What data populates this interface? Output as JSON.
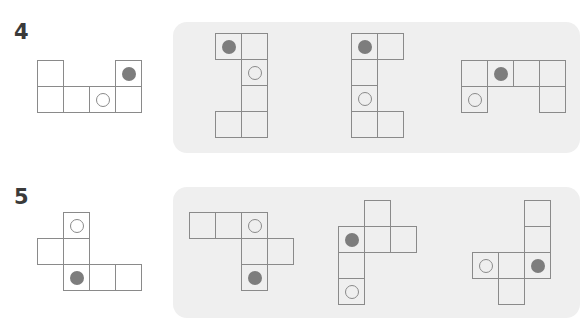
{
  "cell_size": 26,
  "colors": {
    "panel_bg": "#efefef",
    "line": "#8a8a8a",
    "dot": "#7d7d7d",
    "number": "#3a3a3a"
  },
  "problems": [
    {
      "number": "4",
      "number_pos": [
        14,
        22
      ],
      "net": {
        "origin": [
          37,
          60
        ],
        "cells": [
          {
            "c": 0,
            "r": 0
          },
          {
            "c": 3,
            "r": 0,
            "mark": "dot"
          },
          {
            "c": 0,
            "r": 1
          },
          {
            "c": 1,
            "r": 1
          },
          {
            "c": 2,
            "r": 1,
            "mark": "ring"
          },
          {
            "c": 3,
            "r": 1
          }
        ]
      },
      "panel": {
        "x": 173,
        "y": 22,
        "w": 407,
        "h": 131
      },
      "options": [
        {
          "origin": [
            215,
            33
          ],
          "cells": [
            {
              "c": 0,
              "r": 0,
              "mark": "dot"
            },
            {
              "c": 1,
              "r": 0
            },
            {
              "c": 1,
              "r": 1,
              "mark": "ring"
            },
            {
              "c": 1,
              "r": 2
            },
            {
              "c": 0,
              "r": 3
            },
            {
              "c": 1,
              "r": 3
            }
          ]
        },
        {
          "origin": [
            351,
            33
          ],
          "cells": [
            {
              "c": 0,
              "r": 0,
              "mark": "dot"
            },
            {
              "c": 1,
              "r": 0
            },
            {
              "c": 0,
              "r": 1
            },
            {
              "c": 0,
              "r": 2,
              "mark": "ring"
            },
            {
              "c": 0,
              "r": 3
            },
            {
              "c": 1,
              "r": 3
            }
          ]
        },
        {
          "origin": [
            461,
            60
          ],
          "cells": [
            {
              "c": 0,
              "r": 0
            },
            {
              "c": 1,
              "r": 0,
              "mark": "dot"
            },
            {
              "c": 2,
              "r": 0
            },
            {
              "c": 3,
              "r": 0
            },
            {
              "c": 0,
              "r": 1,
              "mark": "ring"
            },
            {
              "c": 3,
              "r": 1
            }
          ]
        }
      ]
    },
    {
      "number": "5",
      "number_pos": [
        14,
        187
      ],
      "net": {
        "origin": [
          37,
          212
        ],
        "cells": [
          {
            "c": 1,
            "r": 0,
            "mark": "ring"
          },
          {
            "c": 0,
            "r": 1
          },
          {
            "c": 1,
            "r": 1
          },
          {
            "c": 1,
            "r": 2,
            "mark": "dot"
          },
          {
            "c": 2,
            "r": 2
          },
          {
            "c": 3,
            "r": 2
          }
        ]
      },
      "panel": {
        "x": 173,
        "y": 187,
        "w": 407,
        "h": 131
      },
      "options": [
        {
          "origin": [
            189,
            212
          ],
          "cells": [
            {
              "c": 0,
              "r": 0
            },
            {
              "c": 1,
              "r": 0
            },
            {
              "c": 2,
              "r": 0,
              "mark": "ring"
            },
            {
              "c": 2,
              "r": 1
            },
            {
              "c": 3,
              "r": 1
            },
            {
              "c": 2,
              "r": 2,
              "mark": "dot"
            }
          ]
        },
        {
          "origin": [
            338,
            200
          ],
          "cells": [
            {
              "c": 1,
              "r": 0
            },
            {
              "c": 0,
              "r": 1,
              "mark": "dot"
            },
            {
              "c": 1,
              "r": 1
            },
            {
              "c": 2,
              "r": 1
            },
            {
              "c": 0,
              "r": 2
            },
            {
              "c": 0,
              "r": 3,
              "mark": "ring"
            }
          ]
        },
        {
          "origin": [
            472,
            200
          ],
          "cells": [
            {
              "c": 2,
              "r": 0
            },
            {
              "c": 2,
              "r": 1
            },
            {
              "c": 0,
              "r": 2,
              "mark": "ring"
            },
            {
              "c": 1,
              "r": 2
            },
            {
              "c": 2,
              "r": 2,
              "mark": "dot"
            },
            {
              "c": 1,
              "r": 3
            }
          ]
        }
      ]
    }
  ]
}
